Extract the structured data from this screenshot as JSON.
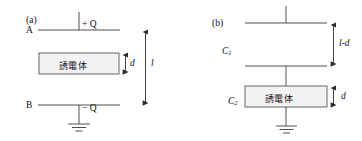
{
  "figure": {
    "panels": [
      {
        "id": "a",
        "label": "(a)",
        "top_plate_label": "A",
        "bottom_plate_label": "B",
        "top_charge": "+ Q",
        "bottom_charge": "− Q",
        "dielectric_label": "誘電体",
        "dim_small": "d",
        "dim_large": "l"
      },
      {
        "id": "b",
        "label": "(b)",
        "cap_top_label": "C",
        "cap_top_sub": "1",
        "cap_bottom_label": "C",
        "cap_bottom_sub": "2",
        "dielectric_label": "誘電体",
        "dim_gap": "l-d",
        "dim_small": "d"
      }
    ],
    "colors": {
      "line": "#3a3a3a",
      "box_fill": "#f2f2f2",
      "box_stroke": "#555555",
      "text": "#111111",
      "background": "#ffffff"
    }
  }
}
